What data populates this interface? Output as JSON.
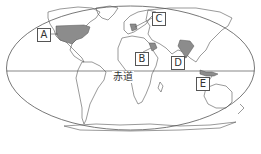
{
  "map": {
    "type": "world-map-outline",
    "projection": "pseudo-cylindrical (elliptical)",
    "equator_label": "赤道",
    "highlight_color": "#8c8c8c",
    "outline_color": "#555555",
    "labels": [
      {
        "id": "A",
        "text": "A",
        "region": "United States"
      },
      {
        "id": "B",
        "text": "B",
        "region": "Middle East (Saudi Arabia area)"
      },
      {
        "id": "C",
        "text": "C",
        "region": "Western Europe"
      },
      {
        "id": "D",
        "text": "D",
        "region": "India"
      },
      {
        "id": "E",
        "text": "E",
        "region": "Indonesia"
      }
    ]
  }
}
